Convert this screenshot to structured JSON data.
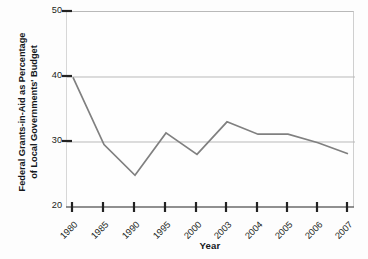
{
  "chart_data": {
    "type": "line",
    "title": "",
    "xlabel": "Year",
    "ylabel": "Federal Grants-in-Aid as Percentage of Local Governments' Budget",
    "ylabel_line1": "Federal Grants-in-Aid as Percentage",
    "ylabel_line2": "of Local Governments' Budget",
    "categories": [
      "1980",
      "1985",
      "1990",
      "1995",
      "2000",
      "2003",
      "2004",
      "2005",
      "2006",
      "2007"
    ],
    "values": [
      40.0,
      29.7,
      25.0,
      31.5,
      28.2,
      33.2,
      31.3,
      31.3,
      30.0,
      28.3
    ],
    "series": [
      {
        "name": "Federal Grants-in-Aid as Percentage of Local Governments' Budget",
        "values": [
          40.0,
          29.7,
          25.0,
          31.5,
          28.2,
          33.2,
          31.3,
          31.3,
          30.0,
          28.3
        ]
      }
    ],
    "ylim": [
      20,
      50
    ],
    "yticks": [
      20,
      30,
      40,
      50
    ],
    "ytick_labels": [
      "20",
      "30",
      "40",
      "50"
    ],
    "xtick_labels": [
      "1980",
      "1985",
      "1990",
      "1995",
      "2000",
      "2003",
      "2004",
      "2005",
      "2006",
      "2007"
    ],
    "grid": "horizontal",
    "gridlines_at": [
      30,
      40,
      50
    ],
    "legend": "none",
    "line_color": "#808080",
    "grid_color": "#b9b9b9",
    "axis_color": "#555555",
    "background_color": "#fefefe"
  }
}
